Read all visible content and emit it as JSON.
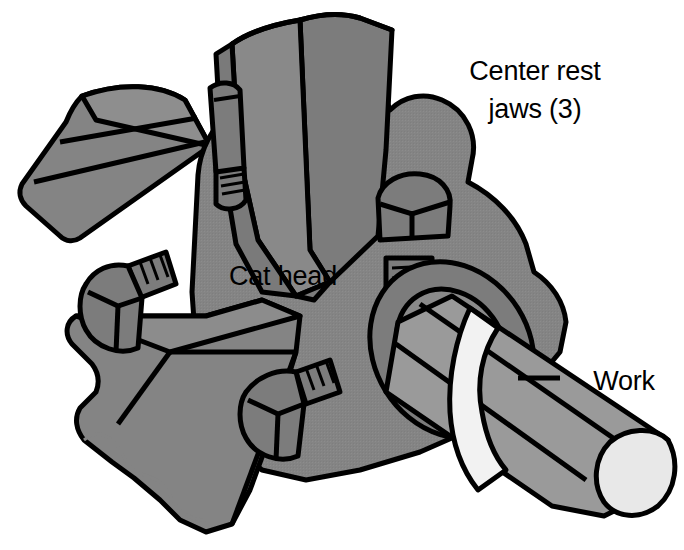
{
  "figure": {
    "background_color": "#ffffff",
    "dimensions": {
      "width": 684,
      "height": 550
    }
  },
  "palette": {
    "outline": "#000000",
    "body_gray": "#848484",
    "mid_gray": "#7c7c7c",
    "light_gray": "#9a9a9a",
    "pale_gray": "#b4b4b4",
    "highlight": "#f2f2f2",
    "white": "#ffffff",
    "shadow_gray": "#6e6e6e"
  },
  "labels": [
    {
      "id": "center-rest-jaws",
      "lines": [
        "Center rest",
        "jaws (3)"
      ],
      "line1": "Center rest",
      "line2": "jaws (3)",
      "x": 535,
      "y": 75,
      "anchor": "middle",
      "has_leader": false
    },
    {
      "id": "cat-head",
      "lines": [
        "Cat head"
      ],
      "line1": "Cat head",
      "x": 283,
      "y": 275,
      "anchor": "middle",
      "has_leader": false
    },
    {
      "id": "work",
      "lines": [
        "Work"
      ],
      "line1": "Work",
      "x": 624,
      "y": 385,
      "anchor": "middle",
      "has_leader": true
    }
  ],
  "parts": [
    {
      "id": "cat-head-body",
      "name": "Cat head",
      "count": 1,
      "fill": "#848484"
    },
    {
      "id": "jaw-top",
      "name": "Center rest jaw (top)",
      "count": 1,
      "fill": "#7c7c7c"
    },
    {
      "id": "jaw-upper-left",
      "name": "Center rest jaw (upper left)",
      "count": 1,
      "fill": "#848484"
    },
    {
      "id": "jaw-lower-left",
      "name": "Center rest jaw (lower left)",
      "count": 1,
      "fill": "#848484"
    },
    {
      "id": "bolt-upper-left",
      "name": "Clamping bolt (upper left)",
      "count": 1,
      "fill": "#7c7c7c"
    },
    {
      "id": "bolt-right",
      "name": "Clamping bolt (right)",
      "count": 1,
      "fill": "#7c7c7c"
    },
    {
      "id": "bolt-left",
      "name": "Clamping bolt (left)",
      "count": 1,
      "fill": "#7c7c7c"
    },
    {
      "id": "bolt-bottom",
      "name": "Clamping bolt (bottom)",
      "count": 1,
      "fill": "#7c7c7c"
    },
    {
      "id": "work-shaft",
      "name": "Work",
      "count": 1,
      "fill": "#9a9a9a"
    },
    {
      "id": "work-collar",
      "name": "Work collar band",
      "count": 1,
      "fill": "#f2f2f2"
    },
    {
      "id": "work-end-face",
      "name": "Work end face",
      "count": 1,
      "fill": "#e8e8e8"
    },
    {
      "id": "hub-boss",
      "name": "Cat head hub boss",
      "count": 1,
      "fill": "#7c7c7c"
    }
  ]
}
